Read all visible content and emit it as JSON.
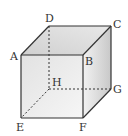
{
  "diagram": {
    "type": "cube",
    "vertices": {
      "A": {
        "label": "A",
        "x": 21,
        "y": 55
      },
      "B": {
        "label": "B",
        "x": 83,
        "y": 55
      },
      "C": {
        "label": "C",
        "x": 111,
        "y": 26
      },
      "D": {
        "label": "D",
        "x": 49,
        "y": 26
      },
      "E": {
        "label": "E",
        "x": 21,
        "y": 118
      },
      "F": {
        "label": "F",
        "x": 83,
        "y": 118
      },
      "G": {
        "label": "G",
        "x": 111,
        "y": 89
      },
      "H": {
        "label": "H",
        "x": 49,
        "y": 89
      }
    },
    "visible_edges": [
      "AB",
      "BC",
      "CD",
      "DA",
      "AE",
      "BF",
      "CG",
      "EF",
      "FG"
    ],
    "hidden_edges": [
      "DH",
      "HE",
      "HG"
    ],
    "colors": {
      "edge": "#333333",
      "face_front": "#d6d6d6",
      "face_top": "#cfcfcf",
      "face_right": "#c4c4c4"
    }
  }
}
